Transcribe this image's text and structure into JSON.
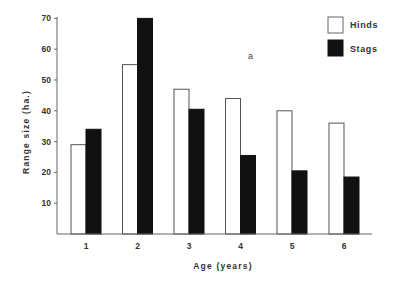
{
  "chart_data": {
    "type": "bar",
    "title": "",
    "xlabel": "Age (years)",
    "ylabel": "Range size (ha.)",
    "categories": [
      "1",
      "2",
      "3",
      "4",
      "5",
      "6"
    ],
    "series": [
      {
        "name": "Hinds",
        "color": "#ffffff",
        "stroke": "#555555",
        "values": [
          29,
          55,
          47,
          44,
          40,
          36
        ]
      },
      {
        "name": "Stags",
        "color": "#111111",
        "stroke": "#111111",
        "values": [
          34,
          70,
          40.5,
          25.5,
          20.5,
          18.5
        ]
      }
    ],
    "yticks": [
      10,
      20,
      30,
      40,
      50,
      60,
      70
    ],
    "ylim": [
      0,
      70
    ],
    "grid": false,
    "legend_position": "top-right",
    "annotations": [
      "a"
    ]
  },
  "legend": {
    "items": [
      {
        "label": "Hinds"
      },
      {
        "label": "Stags"
      }
    ]
  },
  "annotation": {
    "text": "a"
  }
}
